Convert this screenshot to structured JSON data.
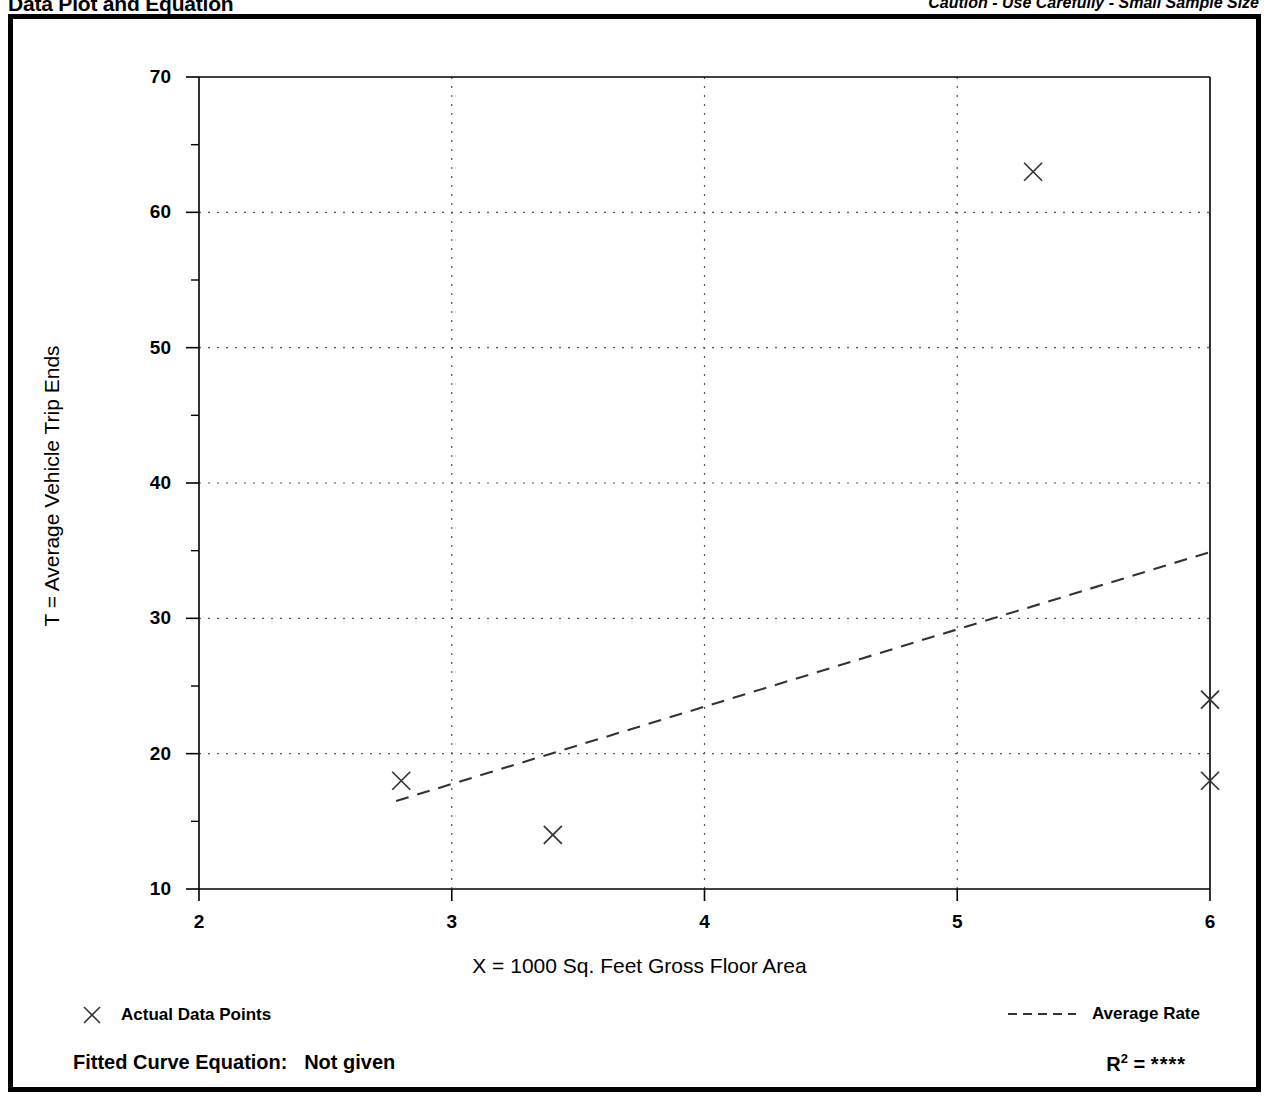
{
  "header": {
    "title": "Data Plot and Equation",
    "caution": "Caution - Use Carefully - Small Sample Size"
  },
  "legend": {
    "data_points_label": "Actual Data Points",
    "data_points_marker": "x-marker-icon",
    "average_rate_label": "Average Rate",
    "average_rate_marker": "dashed-line-icon"
  },
  "footer": {
    "fitted_curve_label": "Fitted Curve Equation:",
    "fitted_curve_value": "Not given",
    "r_symbol": "R",
    "r_exponent": "2",
    "r_equals": "=",
    "r_value": "****"
  },
  "colors": {
    "foreground": "#000000",
    "background": "#ffffff",
    "grid": "#555555",
    "marker": "#333333",
    "trendline": "#333333"
  },
  "chart_data": {
    "type": "scatter",
    "title": "Data Plot and Equation",
    "xlabel": "X = 1000 Sq. Feet Gross Floor Area",
    "ylabel": "T = Average Vehicle Trip Ends",
    "xlim": [
      2,
      6
    ],
    "ylim": [
      10,
      70
    ],
    "xticks": [
      2,
      3,
      4,
      5,
      6
    ],
    "yticks": [
      10,
      20,
      30,
      40,
      50,
      60,
      70
    ],
    "y_minor_ticks": [
      15,
      25,
      35,
      45,
      55,
      65
    ],
    "grid": true,
    "grid_style": "dotted",
    "legend_position": "below-plot",
    "series": [
      {
        "name": "Actual Data Points",
        "type": "scatter",
        "marker": "x",
        "points": [
          {
            "x": 2.8,
            "y": 18
          },
          {
            "x": 3.4,
            "y": 14
          },
          {
            "x": 5.3,
            "y": 63
          },
          {
            "x": 6.0,
            "y": 24
          },
          {
            "x": 6.0,
            "y": 18
          }
        ]
      },
      {
        "name": "Average Rate",
        "type": "line",
        "style": "dashed",
        "points": [
          {
            "x": 2.78,
            "y": 16.5
          },
          {
            "x": 6.0,
            "y": 34.9
          }
        ]
      }
    ]
  }
}
